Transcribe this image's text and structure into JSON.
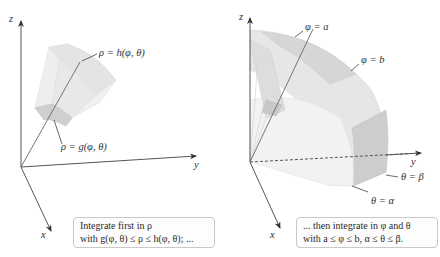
{
  "left_panel": {
    "axes": {
      "z": "z",
      "y": "y",
      "x": "x"
    },
    "labels": {
      "outer_surface": "ρ = h(φ, θ)",
      "inner_surface": "ρ = g(φ, θ)"
    },
    "caption": {
      "line1": "Integrate first in ρ",
      "line2": "with g(φ, θ) ≤ ρ ≤ h(φ, θ); ..."
    }
  },
  "right_panel": {
    "axes": {
      "z": "z",
      "y": "y",
      "x": "x"
    },
    "labels": {
      "phi_a": "φ = a",
      "phi_b": "φ = b",
      "theta_beta": "θ = β",
      "theta_alpha": "θ = α"
    },
    "caption": {
      "line1": "... then integrate in φ and θ",
      "line2": "with a ≤ φ ≤ b, α ≤ θ ≤ β."
    }
  },
  "colors": {
    "axis": "#555555",
    "solid_light": "#ececec",
    "solid_mid": "#dcdcdc",
    "solid_dark": "#c4c4c4"
  }
}
